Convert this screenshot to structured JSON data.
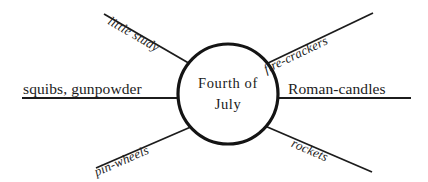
{
  "diagram": {
    "type": "cluster-web-diagram",
    "center": {
      "line1": "Fourth of",
      "line2": "July",
      "shape": "circle",
      "stroke_color": "#141414",
      "fill_color": "#ffffff"
    },
    "background_color": "#ffffff",
    "line_color": "#1c1c1c",
    "spokes": [
      {
        "id": "little-study",
        "label": "little study",
        "position": "upper-left",
        "orientation": "diagonal-up-left",
        "angle_deg": -31
      },
      {
        "id": "fire-crackers",
        "label": "fire-crackers",
        "position": "upper-right",
        "orientation": "diagonal-up-right",
        "angle_deg": -31
      },
      {
        "id": "squibs-gunpowder",
        "label": "squibs, gunpowder",
        "position": "left",
        "orientation": "horizontal",
        "angle_deg": 0
      },
      {
        "id": "roman-candles",
        "label": "Roman-candles",
        "position": "right",
        "orientation": "horizontal",
        "angle_deg": 0
      },
      {
        "id": "pin-wheels",
        "label": "pin-wheels",
        "position": "lower-left",
        "orientation": "diagonal-down-left",
        "angle_deg": 31
      },
      {
        "id": "rockets",
        "label": "rockets",
        "position": "lower-right",
        "orientation": "diagonal-down-right",
        "angle_deg": 31
      }
    ]
  }
}
